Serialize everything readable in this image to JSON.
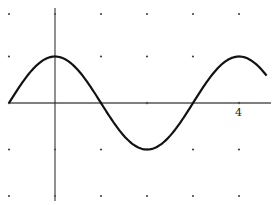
{
  "chart_data": {
    "type": "line",
    "title": "",
    "xlabel": "",
    "ylabel": "",
    "function": "y = cos(pi*x/2)",
    "xlim": [
      -1,
      4.7
    ],
    "ylim": [
      -2,
      2
    ],
    "grid": "dots",
    "grid_dots_x": [
      -1,
      0,
      1,
      2,
      3,
      4
    ],
    "grid_dots_y": [
      2,
      1,
      0,
      -1,
      -2
    ],
    "tick_labels": [
      {
        "axis": "x",
        "value": 4,
        "text": "4"
      }
    ],
    "series": [
      {
        "name": "curve",
        "x": [
          -1,
          -0.5,
          0,
          0.5,
          1,
          1.5,
          2,
          2.5,
          3,
          3.5,
          4,
          4.5
        ],
        "y": [
          0,
          0.707,
          1,
          0.707,
          0,
          -0.707,
          -1,
          -0.707,
          0,
          0.707,
          1,
          0.707
        ]
      }
    ],
    "legend": null
  },
  "labels": {
    "x_tick_4": "4"
  },
  "style": {
    "curve_color": "#111111",
    "axis_color": "#555555",
    "dot_color": "#444444"
  }
}
